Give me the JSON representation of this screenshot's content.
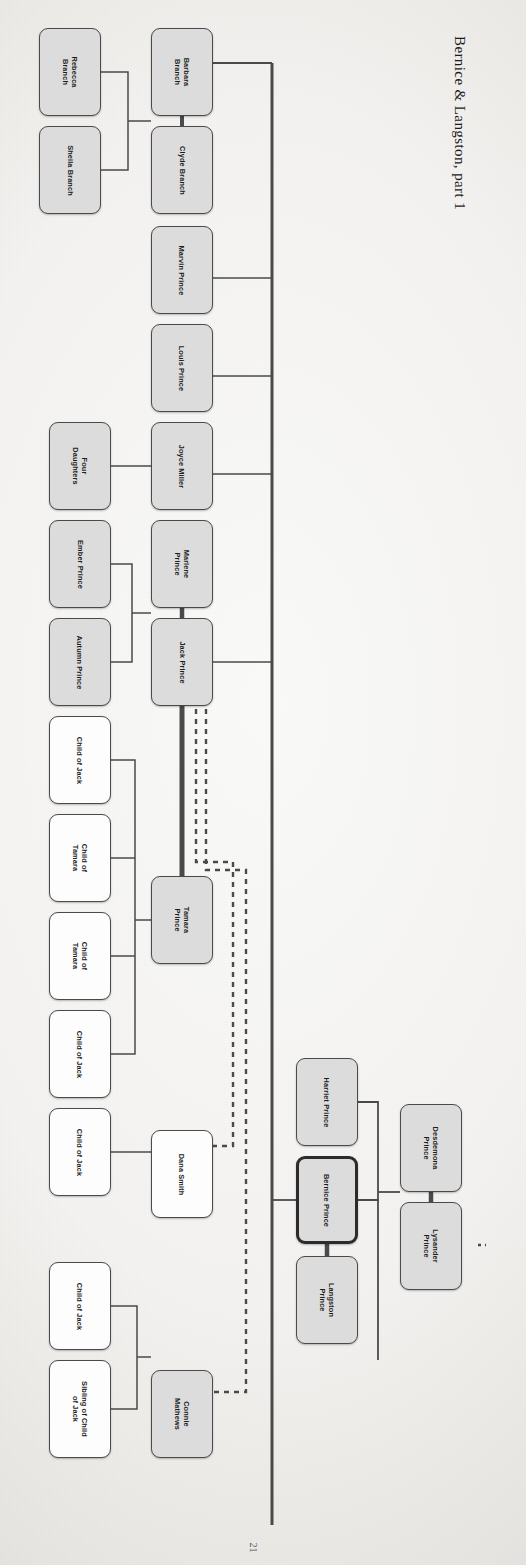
{
  "document": {
    "title": "Bernice & Langston, part 1",
    "page_number": "21",
    "orientation": "rotated-90",
    "type": "family-tree-diagram"
  },
  "colors": {
    "box_fill_gray": "#dcdcdc",
    "box_fill_white": "#fdfdfd",
    "box_border": "#4a4a4a",
    "box_border_highlight": "#2b2b2b",
    "line": "#4a4a4a",
    "paper": "#f4f3f1"
  },
  "legend": {
    "gray_box": "ancestor / named relative",
    "white_box": "unnamed descendant placeholder",
    "bold_box": "focus person",
    "thick_line": "marriage / partnership",
    "thin_line": "parent-child",
    "dashed_line": "inferred or indirect relation"
  },
  "nodes": [
    {
      "id": "rebecca",
      "label": "Rebecca\nBranch",
      "style": "gray",
      "x": 39,
      "y": 28,
      "w": 62,
      "h": 88
    },
    {
      "id": "sheila",
      "label": "Sheila Branch",
      "style": "gray",
      "x": 39,
      "y": 126,
      "w": 62,
      "h": 88
    },
    {
      "id": "barbara",
      "label": "Barbara\nBranch",
      "style": "gray",
      "x": 151,
      "y": 28,
      "w": 62,
      "h": 88
    },
    {
      "id": "clyde",
      "label": "Clyde Branch",
      "style": "gray",
      "x": 151,
      "y": 126,
      "w": 62,
      "h": 88
    },
    {
      "id": "marvin",
      "label": "Marvin Prince",
      "style": "gray",
      "x": 151,
      "y": 226,
      "w": 62,
      "h": 88
    },
    {
      "id": "louis",
      "label": "Louis Prince",
      "style": "gray",
      "x": 151,
      "y": 324,
      "w": 62,
      "h": 88
    },
    {
      "id": "fourdau",
      "label": "Four\nDaughters",
      "style": "gray",
      "x": 49,
      "y": 422,
      "w": 62,
      "h": 88
    },
    {
      "id": "joyce",
      "label": "Joyce Miller",
      "style": "gray",
      "x": 151,
      "y": 422,
      "w": 62,
      "h": 88
    },
    {
      "id": "ember",
      "label": "Ember Prince",
      "style": "gray",
      "x": 49,
      "y": 520,
      "w": 62,
      "h": 88
    },
    {
      "id": "autumn",
      "label": "Autumn Prince",
      "style": "gray",
      "x": 49,
      "y": 618,
      "w": 62,
      "h": 88
    },
    {
      "id": "marlene",
      "label": "Marlene\nPrince",
      "style": "gray",
      "x": 151,
      "y": 520,
      "w": 62,
      "h": 88
    },
    {
      "id": "jack",
      "label": "Jack Prince",
      "style": "gray",
      "x": 151,
      "y": 618,
      "w": 62,
      "h": 88
    },
    {
      "id": "cjack1",
      "label": "Child of Jack",
      "style": "white",
      "x": 49,
      "y": 716,
      "w": 62,
      "h": 88
    },
    {
      "id": "ctam1",
      "label": "Child of\nTamara",
      "style": "white",
      "x": 49,
      "y": 814,
      "w": 62,
      "h": 88
    },
    {
      "id": "ctam2",
      "label": "Child of\nTamara",
      "style": "white",
      "x": 49,
      "y": 912,
      "w": 62,
      "h": 88
    },
    {
      "id": "cjack2",
      "label": "Child of Jack",
      "style": "white",
      "x": 49,
      "y": 1010,
      "w": 62,
      "h": 88
    },
    {
      "id": "cjack3",
      "label": "Child of Jack",
      "style": "white",
      "x": 49,
      "y": 1108,
      "w": 62,
      "h": 88
    },
    {
      "id": "cjack4",
      "label": "Child of Jack",
      "style": "white",
      "x": 49,
      "y": 1262,
      "w": 62,
      "h": 88
    },
    {
      "id": "sibcjack",
      "label": "Sibling of Child\nof Jack",
      "style": "white",
      "x": 49,
      "y": 1360,
      "w": 62,
      "h": 98
    },
    {
      "id": "tamara",
      "label": "Tamara\nPrince",
      "style": "gray",
      "x": 151,
      "y": 876,
      "w": 62,
      "h": 88
    },
    {
      "id": "dana",
      "label": "Dana Smith",
      "style": "white",
      "x": 151,
      "y": 1130,
      "w": 62,
      "h": 88
    },
    {
      "id": "connie",
      "label": "Connie\nMathews",
      "style": "gray",
      "x": 151,
      "y": 1370,
      "w": 62,
      "h": 88
    },
    {
      "id": "harriet",
      "label": "Harriet Prince",
      "style": "gray",
      "x": 296,
      "y": 1058,
      "w": 62,
      "h": 88
    },
    {
      "id": "bernice",
      "label": "Bernice Prince",
      "style": "bold",
      "x": 296,
      "y": 1156,
      "w": 62,
      "h": 88
    },
    {
      "id": "langston",
      "label": "Langston\nPrince",
      "style": "gray",
      "x": 296,
      "y": 1256,
      "w": 62,
      "h": 88
    },
    {
      "id": "desdemona",
      "label": "Desdemona\nPrince",
      "style": "gray",
      "x": 400,
      "y": 1104,
      "w": 62,
      "h": 88
    },
    {
      "id": "lysander",
      "label": "Lysander\nPrince",
      "style": "gray",
      "x": 400,
      "y": 1202,
      "w": 62,
      "h": 88
    }
  ],
  "relationships": [
    {
      "from": "rebecca",
      "to": "barbara",
      "kind": "parent-child"
    },
    {
      "from": "sheila",
      "to": "barbara",
      "kind": "parent-child"
    },
    {
      "from": "barbara",
      "to": "clyde",
      "kind": "marriage"
    },
    {
      "from": "fourdau",
      "to": "joyce",
      "kind": "parent-child"
    },
    {
      "from": "ember",
      "to": "marlene",
      "kind": "parent-child"
    },
    {
      "from": "autumn",
      "to": "marlene",
      "kind": "parent-child"
    },
    {
      "from": "marlene",
      "to": "jack",
      "kind": "marriage"
    },
    {
      "from": "jack",
      "to": "tamara",
      "kind": "marriage"
    },
    {
      "from": "jack",
      "to": "dana",
      "kind": "inferred"
    },
    {
      "from": "jack",
      "to": "connie",
      "kind": "inferred"
    },
    {
      "from": "cjack1",
      "to": "tamara",
      "kind": "parent-child"
    },
    {
      "from": "ctam1",
      "to": "tamara",
      "kind": "parent-child"
    },
    {
      "from": "ctam2",
      "to": "tamara",
      "kind": "parent-child"
    },
    {
      "from": "cjack2",
      "to": "tamara",
      "kind": "parent-child"
    },
    {
      "from": "cjack3",
      "to": "dana",
      "kind": "parent-child"
    },
    {
      "from": "cjack4",
      "to": "connie",
      "kind": "parent-child"
    },
    {
      "from": "sibcjack",
      "to": "connie",
      "kind": "parent-child"
    },
    {
      "from": "harriet",
      "to": "spine",
      "kind": "parent-child"
    },
    {
      "from": "bernice",
      "to": "langston",
      "kind": "marriage"
    },
    {
      "from": "bernice",
      "to": "spine",
      "kind": "parent-child"
    },
    {
      "from": "desdemona",
      "to": "lysander",
      "kind": "marriage"
    },
    {
      "from": "langston",
      "to": "desdemona",
      "kind": "parent-child"
    }
  ]
}
